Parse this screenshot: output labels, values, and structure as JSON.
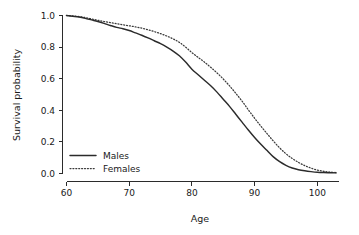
{
  "chart_data": {
    "type": "line",
    "title": "",
    "xlabel": "Age",
    "ylabel": "Survival probability",
    "xlim": [
      60,
      103.5
    ],
    "ylim": [
      0,
      1
    ],
    "grid": false,
    "legend_position": "bottom-left",
    "xticks": [
      "60",
      "70",
      "80",
      "90",
      "100"
    ],
    "xtick_values": [
      60,
      70,
      80,
      90,
      100
    ],
    "yticks": [
      "1.0",
      "0.8",
      "0.6",
      "0.4",
      "0.2",
      "0.0"
    ],
    "ytick_values": [
      1.0,
      0.8,
      0.6,
      0.4,
      0.2,
      0.0
    ],
    "x": [
      60,
      61,
      62,
      63,
      64,
      65,
      66,
      67,
      68,
      69,
      70,
      71,
      72,
      73,
      74,
      75,
      76,
      77,
      78,
      79,
      80,
      81,
      82,
      83,
      84,
      85,
      86,
      87,
      88,
      89,
      90,
      91,
      92,
      93,
      94,
      95,
      96,
      97,
      98,
      99,
      100,
      101,
      102,
      103
    ],
    "series": [
      {
        "name": "Males",
        "style": "solid",
        "color": "#2b2b2b",
        "values": [
          1.0,
          0.995,
          0.99,
          0.982,
          0.972,
          0.962,
          0.95,
          0.937,
          0.925,
          0.916,
          0.905,
          0.89,
          0.875,
          0.858,
          0.84,
          0.822,
          0.8,
          0.775,
          0.745,
          0.705,
          0.66,
          0.625,
          0.59,
          0.555,
          0.515,
          0.47,
          0.425,
          0.375,
          0.325,
          0.275,
          0.228,
          0.185,
          0.145,
          0.105,
          0.075,
          0.052,
          0.035,
          0.024,
          0.017,
          0.012,
          0.008,
          0.006,
          0.005,
          0.004
        ]
      },
      {
        "name": "Females",
        "style": "dotted",
        "color": "#3a3a3a",
        "values": [
          1.0,
          0.997,
          0.993,
          0.987,
          0.978,
          0.97,
          0.962,
          0.955,
          0.948,
          0.941,
          0.935,
          0.928,
          0.92,
          0.91,
          0.898,
          0.885,
          0.87,
          0.852,
          0.83,
          0.8,
          0.765,
          0.735,
          0.705,
          0.672,
          0.637,
          0.598,
          0.555,
          0.508,
          0.458,
          0.403,
          0.35,
          0.3,
          0.252,
          0.205,
          0.162,
          0.125,
          0.095,
          0.07,
          0.05,
          0.034,
          0.022,
          0.014,
          0.009,
          0.006
        ]
      }
    ],
    "legend": [
      {
        "label": "Males",
        "style": "solid"
      },
      {
        "label": "Females",
        "style": "dotted"
      }
    ]
  }
}
